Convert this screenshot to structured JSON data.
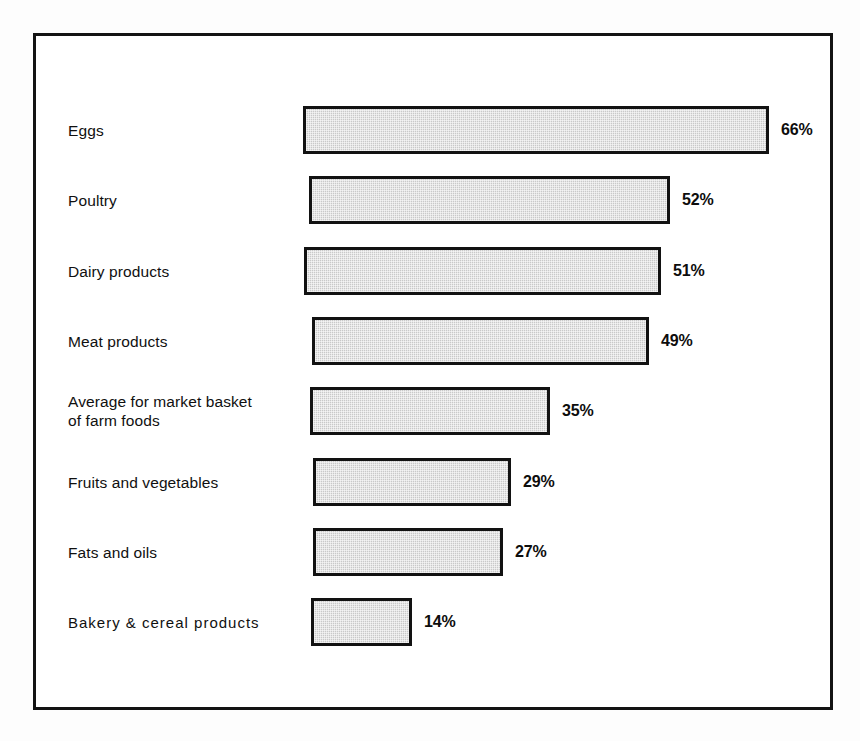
{
  "figure": {
    "background_color": "#ffffff",
    "frame_color": "#131313",
    "bar_fill_color": "#c9c9c9",
    "bar_border_color": "#121212",
    "text_color": "#101010"
  },
  "chart_data": {
    "type": "bar",
    "orientation": "horizontal",
    "title": "",
    "subtitle": "",
    "xlabel": "",
    "ylabel": "",
    "xlim": [
      0,
      66
    ],
    "grid": false,
    "legend": false,
    "value_suffix": "%",
    "categories": [
      "Eggs",
      "Poultry",
      "Dairy products",
      "Meat products",
      "Average for market basket\nof farm foods",
      "Fruits and vegetables",
      "Fats and oils",
      "Bakery & cereal products"
    ],
    "values": [
      66,
      52,
      51,
      49,
      35,
      29,
      27,
      14
    ],
    "value_labels": [
      "66%",
      "52%",
      "51%",
      "49%",
      "35%",
      "29%",
      "27%",
      "14%"
    ]
  },
  "rows": [
    {
      "label": "Eggs",
      "value_label": "66%",
      "bar_left": 267,
      "bar_width": 466,
      "top": 70,
      "spaced": false
    },
    {
      "label": "Poultry",
      "value_label": "52%",
      "bar_left": 273,
      "bar_width": 361,
      "top": 140,
      "spaced": false
    },
    {
      "label": "Dairy products",
      "value_label": "51%",
      "bar_left": 268,
      "bar_width": 357,
      "top": 211,
      "spaced": false
    },
    {
      "label": "Meat products",
      "value_label": "49%",
      "bar_left": 276,
      "bar_width": 337,
      "top": 281,
      "spaced": false
    },
    {
      "label": "Average for market basket\nof farm foods",
      "value_label": "35%",
      "bar_left": 274,
      "bar_width": 240,
      "top": 351,
      "spaced": false
    },
    {
      "label": "Fruits and vegetables",
      "value_label": "29%",
      "bar_left": 277,
      "bar_width": 198,
      "top": 422,
      "spaced": false
    },
    {
      "label": "Fats and oils",
      "value_label": "27%",
      "bar_left": 277,
      "bar_width": 190,
      "top": 492,
      "spaced": false
    },
    {
      "label": "Bakery & cereal products",
      "value_label": "14%",
      "bar_left": 275,
      "bar_width": 101,
      "top": 562,
      "spaced": true
    }
  ]
}
